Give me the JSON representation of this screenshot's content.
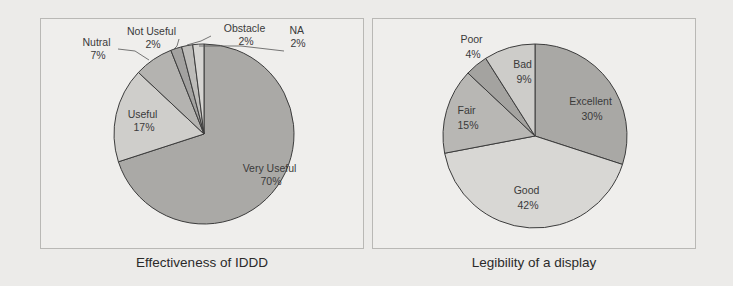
{
  "chart_data": [
    {
      "type": "pie",
      "title": "Effectiveness of IDDD",
      "start_angle": "12 o'clock, clockwise",
      "categories": [
        "Very Useful",
        "Useful",
        "Nutral",
        "Not Useful",
        "Obstacle",
        "NA"
      ],
      "values": [
        70,
        17,
        7,
        2,
        2,
        2
      ],
      "labels": [
        "Very Useful\n70%",
        "Useful\n17%",
        "Nutral\n7%",
        "Not Useful\n2%",
        "Obstacle\n2%",
        "NA\n2%"
      ],
      "colors": [
        "#aaa9a6",
        "#cfcecb",
        "#b4b3b0",
        "#a3a2a0",
        "#bdbcb9",
        "#d6d5d2"
      ]
    },
    {
      "type": "pie",
      "title": "Legibility of a display",
      "start_angle": "12 o'clock, clockwise",
      "categories": [
        "Excellent",
        "Good",
        "Fair",
        "Poor",
        "Bad"
      ],
      "values": [
        30,
        42,
        15,
        4,
        9
      ],
      "labels": [
        "Excellent\n30%",
        "Good\n42%",
        "Fair\n15%",
        "Poor\n4%",
        "Bad\n9%"
      ],
      "colors": [
        "#a9a8a5",
        "#d8d7d4",
        "#b8b7b4",
        "#a4a3a0",
        "#cdccc9"
      ]
    }
  ],
  "charts": {
    "left": {
      "caption": "Effectiveness of IDDD",
      "slices": [
        {
          "name": "Very Useful",
          "pct": "70%"
        },
        {
          "name": "Useful",
          "pct": "17%"
        },
        {
          "name": "Nutral",
          "pct": "7%"
        },
        {
          "name": "Not Useful",
          "pct": "2%"
        },
        {
          "name": "Obstacle",
          "pct": "2%"
        },
        {
          "name": "NA",
          "pct": "2%"
        }
      ]
    },
    "right": {
      "caption": "Legibility of a display",
      "slices": [
        {
          "name": "Excellent",
          "pct": "30%"
        },
        {
          "name": "Good",
          "pct": "42%"
        },
        {
          "name": "Fair",
          "pct": "15%"
        },
        {
          "name": "Poor",
          "pct": "4%"
        },
        {
          "name": "Bad",
          "pct": "9%"
        }
      ]
    }
  }
}
